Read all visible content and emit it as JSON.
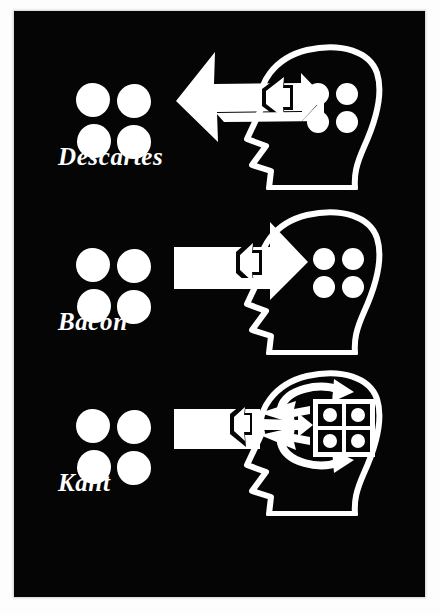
{
  "figure": {
    "background_color": "#ffffff",
    "plate_color": "#050505",
    "ink_color": "#ffffff"
  },
  "panels": [
    {
      "id": "descartes",
      "caption": "Descartes",
      "external_dots": {
        "count": 4,
        "arrangement": "2x2",
        "label": "four-dot-cluster"
      },
      "head": {
        "label": "profile-head-outline",
        "facing": "right",
        "inner_dots": {
          "count": 4,
          "arrangement": "2x2",
          "boxed": false
        }
      },
      "arrow": {
        "label": "arrow-left",
        "direction": "left",
        "style": "double-headed-outward",
        "meaning": "ideas project from mind to world"
      }
    },
    {
      "id": "bacon",
      "caption": "Bacon",
      "external_dots": {
        "count": 4,
        "arrangement": "2x2",
        "label": "four-dot-cluster"
      },
      "head": {
        "label": "profile-head-outline",
        "facing": "right",
        "inner_dots": {
          "count": 4,
          "arrangement": "2x2",
          "boxed": false
        }
      },
      "arrow": {
        "label": "arrow-right",
        "direction": "right",
        "style": "double-headed-inward",
        "meaning": "impressions flow from world into mind"
      }
    },
    {
      "id": "kant",
      "caption": "Kant",
      "external_dots": {
        "count": 4,
        "arrangement": "2x2",
        "label": "four-dot-cluster"
      },
      "head": {
        "label": "profile-head-outline",
        "facing": "right",
        "inner_dots": {
          "count": 4,
          "arrangement": "2x2",
          "boxed": true
        },
        "grid_box": {
          "rows": 2,
          "cols": 2,
          "label": "category-grid"
        },
        "loop_arrow": {
          "label": "circular-arrow",
          "direction": "clockwise"
        }
      },
      "arrow": {
        "label": "arrow-right-splitting",
        "direction": "right",
        "style": "fan-split-three-prong",
        "meaning": "input is organised by the mind's categories"
      }
    }
  ]
}
